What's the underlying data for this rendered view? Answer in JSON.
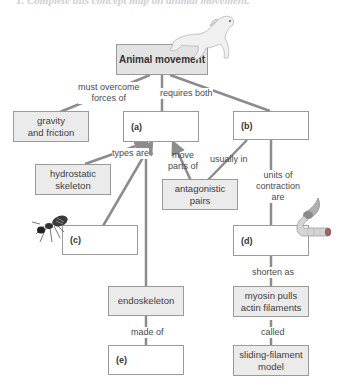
{
  "heading": "1. Complete this concept map on animal movement.",
  "nodes": {
    "root": "Animal movement",
    "gravity": [
      "gravity",
      "and friction"
    ],
    "a": "(a)",
    "b": "(b)",
    "hydrostatic": [
      "hydrostatic",
      "skeleton"
    ],
    "antagonistic": [
      "antagonistic",
      "pairs"
    ],
    "c": "(c)",
    "d": "(d)",
    "endoskeleton": "endoskeleton",
    "myosin": [
      "myosin pulls",
      "actin filaments"
    ],
    "e": "(e)",
    "sliding": [
      "sliding-filament",
      "model"
    ]
  },
  "links": {
    "must_overcome": [
      "must overcome",
      "forces of"
    ],
    "requires_both": "requires both",
    "types_are": "types are",
    "move_parts": [
      "move",
      "parts of"
    ],
    "usually_in": "usually in",
    "units": [
      "units of",
      "contraction",
      "are"
    ],
    "shorten_as": "shorten as",
    "made_of": "made of",
    "called": "called"
  },
  "images": [
    "horse-illustration",
    "ant-illustration",
    "muscle-fiber-illustration"
  ],
  "colors": {
    "box_fill": "#ebebeb",
    "line": "#8c8c8c",
    "border": "#9a9a9a"
  }
}
